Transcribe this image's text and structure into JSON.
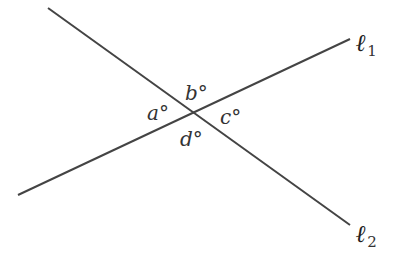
{
  "diagram": {
    "type": "intersecting-lines",
    "lines": [
      {
        "id": "l1",
        "label": "ℓ",
        "subscript": "1",
        "from": [
          18,
          195
        ],
        "to": [
          350,
          39
        ]
      },
      {
        "id": "l2",
        "label": "ℓ",
        "subscript": "2",
        "from": [
          48,
          8
        ],
        "to": [
          350,
          225
        ]
      }
    ],
    "intersection": [
      193,
      113
    ],
    "angles": [
      {
        "id": "a",
        "label": "a°",
        "position": "left"
      },
      {
        "id": "b",
        "label": "b°",
        "position": "top"
      },
      {
        "id": "c",
        "label": "c°",
        "position": "right"
      },
      {
        "id": "d",
        "label": "d°",
        "position": "bottom"
      }
    ],
    "line_color": "#444444"
  }
}
